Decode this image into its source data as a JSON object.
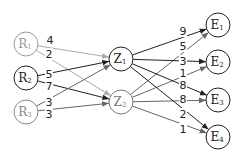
{
  "diagram": {
    "type": "layered-network",
    "layers": [
      {
        "name": "R",
        "nodes": [
          {
            "id": "R1",
            "base": "R",
            "sub": "1",
            "x": 26,
            "y": 44,
            "color": "#999999"
          },
          {
            "id": "R2",
            "base": "R",
            "sub": "2",
            "x": 26,
            "y": 78,
            "color": "#222222"
          },
          {
            "id": "R3",
            "base": "R",
            "sub": "3",
            "x": 26,
            "y": 112,
            "color": "#888888"
          }
        ]
      },
      {
        "name": "Z",
        "nodes": [
          {
            "id": "Z1",
            "base": "Z",
            "sub": "1",
            "x": 121,
            "y": 59,
            "color": "#222222"
          },
          {
            "id": "Z2",
            "base": "Z",
            "sub": "2",
            "x": 121,
            "y": 102,
            "color": "#777777"
          }
        ]
      },
      {
        "name": "E",
        "nodes": [
          {
            "id": "E1",
            "base": "E",
            "sub": "1",
            "x": 218,
            "y": 25,
            "color": "#222222"
          },
          {
            "id": "E2",
            "base": "E",
            "sub": "2",
            "x": 218,
            "y": 62,
            "color": "#222222"
          },
          {
            "id": "E3",
            "base": "E",
            "sub": "3",
            "x": 218,
            "y": 100,
            "color": "#222222"
          },
          {
            "id": "E4",
            "base": "E",
            "sub": "4",
            "x": 218,
            "y": 137,
            "color": "#222222"
          }
        ]
      }
    ],
    "edges": [
      {
        "from": "R1",
        "to": "Z1",
        "weight": "4",
        "color": "#aaaaaa",
        "lx": 50,
        "ly": 40
      },
      {
        "from": "R1",
        "to": "Z2",
        "weight": "2",
        "color": "#aaaaaa",
        "lx": 49,
        "ly": 54
      },
      {
        "from": "R2",
        "to": "Z1",
        "weight": "5",
        "color": "#222222",
        "lx": 49,
        "ly": 74
      },
      {
        "from": "R2",
        "to": "Z2",
        "weight": "7",
        "color": "#222222",
        "lx": 49,
        "ly": 86
      },
      {
        "from": "R3",
        "to": "Z1",
        "weight": "3",
        "color": "#666666",
        "lx": 49,
        "ly": 102
      },
      {
        "from": "R3",
        "to": "Z2",
        "weight": "3",
        "color": "#666666",
        "lx": 49,
        "ly": 114
      },
      {
        "from": "Z1",
        "to": "E1",
        "weight": "9",
        "color": "#222222",
        "lx": 183,
        "ly": 31
      },
      {
        "from": "Z2",
        "to": "E1",
        "weight": "5",
        "color": "#666666",
        "lx": 183,
        "ly": 46
      },
      {
        "from": "Z1",
        "to": "E2",
        "weight": "3",
        "color": "#222222",
        "lx": 183,
        "ly": 61
      },
      {
        "from": "Z2",
        "to": "E2",
        "weight": "1",
        "color": "#666666",
        "lx": 183,
        "ly": 73
      },
      {
        "from": "Z1",
        "to": "E3",
        "weight": "8",
        "color": "#222222",
        "lx": 183,
        "ly": 85
      },
      {
        "from": "Z2",
        "to": "E3",
        "weight": "8",
        "color": "#666666",
        "lx": 183,
        "ly": 99
      },
      {
        "from": "Z1",
        "to": "E4",
        "weight": "2",
        "color": "#222222",
        "lx": 183,
        "ly": 114
      },
      {
        "from": "Z2",
        "to": "E4",
        "weight": "1",
        "color": "#666666",
        "lx": 183,
        "ly": 129
      }
    ],
    "node_radius": 12
  }
}
